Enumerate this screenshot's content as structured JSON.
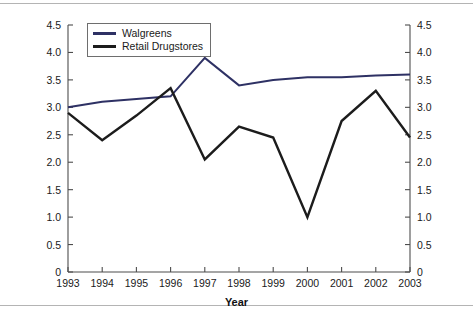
{
  "chart_data": {
    "type": "line",
    "title": "",
    "xlabel": "Year",
    "ylabel": "Net Profit Margin (%)",
    "categories": [
      "1993",
      "1994",
      "1995",
      "1996",
      "1997",
      "1998",
      "1999",
      "2000",
      "2001",
      "2002",
      "2003"
    ],
    "xlim": [
      1993,
      2003
    ],
    "ylim": [
      0,
      4.5
    ],
    "ytick_labels": [
      "4.5",
      "4.0",
      "3.5",
      "3.0",
      "2.5",
      "2.0",
      "1.5",
      "1.0",
      "0.5",
      "0"
    ],
    "ytick_values": [
      4.5,
      4.0,
      3.5,
      3.0,
      2.5,
      2.0,
      1.5,
      1.0,
      0.5,
      0
    ],
    "right_axis_mirrored": true,
    "grid": false,
    "legend_position": "top-left-inside",
    "series": [
      {
        "name": "Walgreens",
        "color": "#2e3164",
        "values": [
          3.0,
          3.1,
          3.15,
          3.2,
          3.9,
          3.4,
          3.5,
          3.55,
          3.55,
          3.58,
          3.6
        ]
      },
      {
        "name": "Retail Drugstores",
        "color": "#1c1c1c",
        "values": [
          2.9,
          2.4,
          2.85,
          3.35,
          2.05,
          2.65,
          2.45,
          1.0,
          2.75,
          3.3,
          2.45
        ]
      }
    ]
  },
  "axis": {
    "frame_color": "#4d4d4d"
  }
}
